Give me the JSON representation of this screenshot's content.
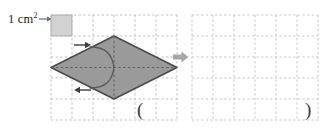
{
  "figure": {
    "type": "area-of-rhombus-on-grid",
    "background_color": "#ffffff"
  },
  "legend": {
    "label_value": "1 cm",
    "label_exponent": "2",
    "icon_name": "legend-pointer-arrow",
    "swatch_fill": "#d2d2d2",
    "swatch_stroke": "#9b9b9b",
    "arrow_color": "#6f6f6f"
  },
  "grids": {
    "columns": 6,
    "rows": 5,
    "cell_size_px": 21,
    "line_color": "#b9b9c4",
    "line_style": "dashed",
    "left": {
      "name": "source-grid",
      "has_shape": true,
      "shaded_unit_cell": {
        "col": 0,
        "row": 0
      }
    },
    "right": {
      "name": "target-grid",
      "has_shape": false
    }
  },
  "shape": {
    "name": "rhombus",
    "fill": "#9a9a9a",
    "stroke": "#4a4a4a",
    "diagonal_horizontal_cells": 6,
    "diagonal_vertical_cells": 3,
    "vertices_cells": [
      {
        "x": 0,
        "y": 2.5
      },
      {
        "x": 3,
        "y": 1
      },
      {
        "x": 6,
        "y": 2.5
      },
      {
        "x": 3,
        "y": 4
      }
    ],
    "diagonal_line_color": "#5c5c5c",
    "cut_curves": [
      {
        "name": "upper-cut-curve"
      },
      {
        "name": "lower-cut-curve"
      }
    ],
    "cut_arrows": [
      {
        "name": "upper-cut-arrow",
        "direction": "right"
      },
      {
        "name": "lower-cut-arrow",
        "direction": "left"
      }
    ],
    "cut_arrow_color": "#3d3d3d"
  },
  "transform_arrow": {
    "name": "transform-arrow",
    "direction": "right",
    "color": "#a6a6a6"
  },
  "answer_blank": {
    "open_paren": "(",
    "close_paren": ")"
  }
}
